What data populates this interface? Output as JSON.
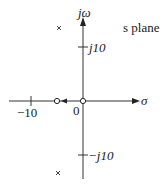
{
  "diagram": {
    "title": "s plane",
    "axes": {
      "real_label": "σ",
      "imag_label": "jω"
    },
    "ticks": {
      "real_neg10": "−10",
      "origin": "0",
      "imag_pos10": "j10",
      "imag_neg10": "−j10"
    },
    "markers": {
      "poles": [
        {
          "label": "pole-upper",
          "symbol": "x",
          "approx_s": "-5 + j12"
        },
        {
          "label": "pole-lower",
          "symbol": "x",
          "approx_s": "-5 - j12"
        }
      ],
      "zeros": [
        {
          "label": "zero-origin",
          "symbol": "o",
          "s": "0"
        },
        {
          "label": "zero-left",
          "symbol": "o",
          "approx_s": "-5"
        }
      ]
    },
    "colors": {
      "ink": "#222222",
      "background": "#ffffff"
    }
  }
}
